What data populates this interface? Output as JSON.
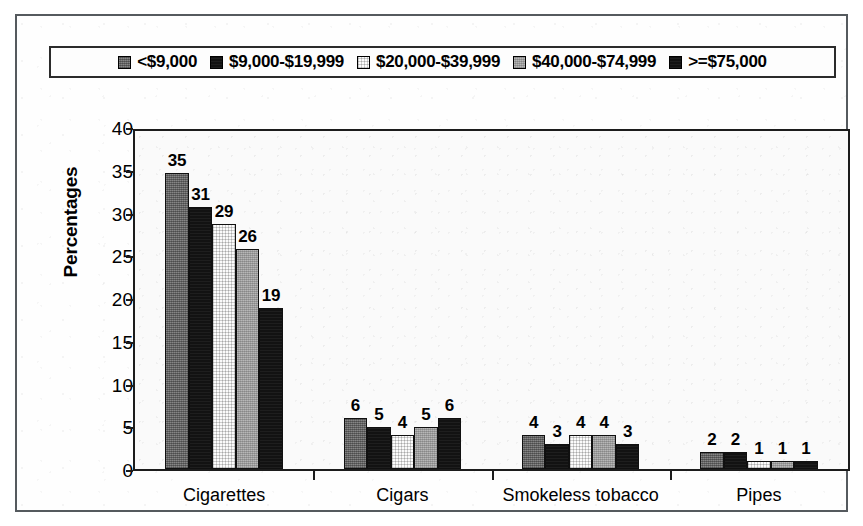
{
  "figure": {
    "y_axis_title": "Percentages",
    "frame_color": "#555a5e",
    "axis_color": "#1c1c1c"
  },
  "legend": {
    "position": "top",
    "entries": [
      {
        "label": "<$9,000",
        "swatch": "dark-gray-swatch",
        "fill_class": "fill-darkgray",
        "color": "#6f6f6f"
      },
      {
        "label": "$9,000-$19,999",
        "swatch": "black-swatch",
        "fill_class": "fill-black",
        "color": "#121212"
      },
      {
        "label": "$20,000-$39,999",
        "swatch": "white-swatch",
        "fill_class": "fill-white",
        "color": "#fbfbfb"
      },
      {
        "label": "$40,000-$74,999",
        "swatch": "medium-gray-swatch",
        "fill_class": "fill-midgray",
        "color": "#a3a3a3"
      },
      {
        "label": ">=$75,000",
        "swatch": "black-swatch",
        "fill_class": "fill-black",
        "color": "#121212"
      }
    ]
  },
  "y_axis": {
    "ticks": [
      "0",
      "5",
      "10",
      "15",
      "20",
      "25",
      "30",
      "35",
      "40"
    ],
    "min": 0,
    "max": 40,
    "step": 5
  },
  "chart_data": {
    "type": "bar",
    "title": "",
    "xlabel": "",
    "ylabel": "Percentages",
    "ylim": [
      0,
      40
    ],
    "grid": false,
    "legend_position": "top",
    "categories": [
      "Cigarettes",
      "Cigars",
      "Smokeless tobacco",
      "Pipes"
    ],
    "series": [
      {
        "name": "<$9,000",
        "values": [
          35,
          6,
          4,
          2
        ]
      },
      {
        "name": "$9,000-$19,999",
        "values": [
          31,
          5,
          3,
          2
        ]
      },
      {
        "name": "$20,000-$39,999",
        "values": [
          29,
          4,
          4,
          1
        ]
      },
      {
        "name": "$40,000-$74,999",
        "values": [
          26,
          5,
          4,
          1
        ]
      },
      {
        "name": ">=$75,000",
        "values": [
          19,
          6,
          3,
          1
        ]
      }
    ],
    "data_labels": [
      [
        "35",
        "31",
        "29",
        "26",
        "19"
      ],
      [
        "6",
        "5",
        "4",
        "5",
        "6"
      ],
      [
        "4",
        "3",
        "4",
        "4",
        "3"
      ],
      [
        "2",
        "2",
        "1",
        "1",
        "1"
      ]
    ]
  }
}
